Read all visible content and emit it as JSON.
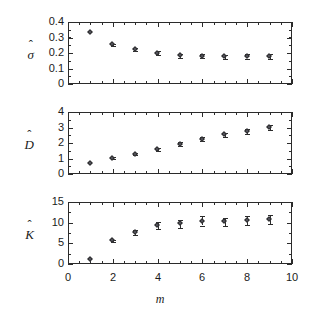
{
  "figure": {
    "xlabel": "m",
    "xlim": [
      0,
      10
    ],
    "xticks": [
      "0",
      "2",
      "4",
      "6",
      "8",
      "10"
    ],
    "xtick_values": [
      0,
      2,
      4,
      6,
      8,
      10
    ],
    "marker_color": "#55555f",
    "axis_color": "#2b2b2b",
    "background": "#ffffff"
  },
  "chart_data": [
    {
      "type": "scatter",
      "title": "",
      "panel_index": 0,
      "ylabel": "σ̂",
      "ylabel_base": "σ",
      "xlabel": "",
      "xlim": [
        0,
        10
      ],
      "ylim": [
        0,
        0.4
      ],
      "yticks": [
        "0",
        "0.1",
        "0.2",
        "0.3",
        "0.4"
      ],
      "ytick_values": [
        0,
        0.1,
        0.2,
        0.3,
        0.4
      ],
      "grid": false,
      "legend": "none",
      "x": [
        1,
        2,
        3,
        4,
        5,
        6,
        7,
        8,
        9
      ],
      "values": [
        0.335,
        0.252,
        0.222,
        0.198,
        0.182,
        0.179,
        0.176,
        0.177,
        0.176
      ],
      "yerr": [
        0.004,
        0.006,
        0.008,
        0.012,
        0.014,
        0.014,
        0.014,
        0.014,
        0.015
      ]
    },
    {
      "type": "scatter",
      "title": "",
      "panel_index": 1,
      "ylabel": "D̂",
      "ylabel_base": "D",
      "xlabel": "",
      "xlim": [
        0,
        10
      ],
      "ylim": [
        0,
        4
      ],
      "yticks": [
        "0",
        "1",
        "2",
        "3",
        "4"
      ],
      "ytick_values": [
        0,
        1,
        2,
        3,
        4
      ],
      "grid": false,
      "legend": "none",
      "x": [
        1,
        2,
        3,
        4,
        5,
        6,
        7,
        8,
        9
      ],
      "values": [
        0.7,
        1.03,
        1.27,
        1.6,
        1.93,
        2.23,
        2.52,
        2.75,
        3.0
      ],
      "yerr": [
        0.04,
        0.06,
        0.06,
        0.09,
        0.11,
        0.13,
        0.14,
        0.17,
        0.19
      ]
    },
    {
      "type": "scatter",
      "title": "",
      "panel_index": 2,
      "ylabel": "K̂",
      "ylabel_base": "K",
      "xlabel": "m",
      "xlim": [
        0,
        10
      ],
      "ylim": [
        0,
        15
      ],
      "yticks": [
        "0",
        "5",
        "10",
        "15"
      ],
      "ytick_values": [
        0,
        5,
        10,
        15
      ],
      "grid": false,
      "legend": "none",
      "x": [
        1,
        2,
        3,
        4,
        5,
        6,
        7,
        8,
        9
      ],
      "values": [
        1.2,
        5.6,
        7.7,
        9.3,
        9.7,
        10.4,
        10.2,
        10.5,
        10.7
      ],
      "yerr": [
        0.15,
        0.3,
        0.6,
        0.9,
        1.0,
        1.1,
        1.0,
        1.1,
        1.1
      ]
    }
  ]
}
